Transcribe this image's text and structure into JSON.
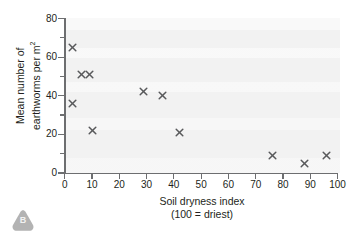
{
  "badge": {
    "label": "B",
    "shape": "rounded-triangle",
    "color": "#b3b3b3"
  },
  "chart_data": {
    "type": "scatter",
    "title": "",
    "xlabel": "Soil dryness index",
    "xlabel_sub": "(100 = driest)",
    "ylabel_line1": "Mean number of",
    "ylabel_line2": "earthworms per m",
    "ylabel_sup": "2",
    "xlim": [
      0,
      100
    ],
    "ylim": [
      0,
      80
    ],
    "xticks": [
      0,
      10,
      20,
      30,
      40,
      50,
      60,
      70,
      80,
      90,
      100
    ],
    "xtick_labels": [
      "0",
      "10",
      "20",
      "30",
      "40",
      "50",
      "60",
      "70",
      "80",
      "90",
      "100"
    ],
    "yticks_major": [
      0,
      20,
      40,
      60,
      80
    ],
    "ytick_labels": [
      "0",
      "20",
      "40",
      "60",
      "80"
    ],
    "yticks_minor": [
      10,
      30,
      50,
      70
    ],
    "grid": false,
    "legend": null,
    "marker": "x",
    "marker_color": "#58595b",
    "plot_background": "#f2f2f2",
    "axis_color": "#6d6e70",
    "points": [
      {
        "x": 3,
        "y": 65
      },
      {
        "x": 3,
        "y": 36
      },
      {
        "x": 6,
        "y": 51
      },
      {
        "x": 9,
        "y": 51
      },
      {
        "x": 10,
        "y": 22
      },
      {
        "x": 29,
        "y": 42
      },
      {
        "x": 36,
        "y": 40
      },
      {
        "x": 42,
        "y": 21
      },
      {
        "x": 76,
        "y": 9
      },
      {
        "x": 88,
        "y": 5
      },
      {
        "x": 96,
        "y": 9
      }
    ]
  }
}
